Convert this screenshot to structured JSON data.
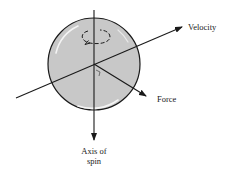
{
  "diagram": {
    "type": "physics-vector-diagram",
    "labels": {
      "velocity": "Velocity",
      "force": "Force",
      "axis_line1": "Axis of",
      "axis_line2": "spin"
    },
    "elements": [
      {
        "id": "ball",
        "shape": "circle",
        "fill": "#c8c8c8",
        "stroke": "#1a1a1a"
      },
      {
        "id": "spin-axis",
        "shape": "arrow",
        "direction": "down",
        "label": "Axis of spin"
      },
      {
        "id": "velocity-vector",
        "shape": "arrow",
        "direction": "up-right",
        "label": "Velocity"
      },
      {
        "id": "force-vector",
        "shape": "arrow",
        "direction": "down-right",
        "label": "Force"
      },
      {
        "id": "spin-arrow",
        "shape": "curved-arrow",
        "direction": "rotation about vertical axis"
      },
      {
        "id": "right-angle-marker",
        "shape": "small-square",
        "meaning": "force perpendicular to velocity"
      }
    ],
    "colors": {
      "ball_fill": "#c8c8c8",
      "line": "#1a1a1a",
      "highlight": "#f4f4f4",
      "background": "#ffffff"
    }
  }
}
